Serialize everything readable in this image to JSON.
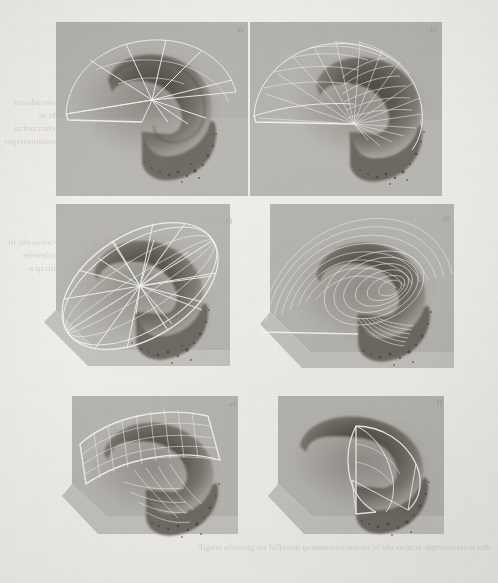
{
  "figure": {
    "kind": "scanned-halftone-figure",
    "medium": "grayscale scanned page from printed article",
    "caption_visible": false,
    "page_background": "#f2f0ec",
    "plate_background": "#b9b7b2",
    "wireframe_color": "#f4f3f0",
    "subject_color": "#5a564f",
    "layout": {
      "rows": 3,
      "columns": 2,
      "panel_count": 6
    },
    "bleed_through_text_visible": true
  },
  "panels": [
    {
      "id": "a",
      "label": "a)",
      "position": "top-left",
      "overlay_type": "radial-fan-wireframe",
      "description": "Dark spiral shell rendered inside a grey box, overlaid with an open fan of radial spokes meeting at a central apex and bounded by a wide circular arc.",
      "x": 56,
      "y": 22,
      "w": 192,
      "h": 174
    },
    {
      "id": "b",
      "label": "b)",
      "position": "top-right",
      "overlay_type": "dense-ruled-surface",
      "description": "Same shell overlaid with a dense family of nearly parallel ruling lines sweeping from the outer arc into the spiral core.",
      "x": 250,
      "y": 22,
      "w": 192,
      "h": 174
    },
    {
      "id": "c",
      "label": "c)",
      "position": "middle-left",
      "overlay_type": "elliptical-ring-with-spokes",
      "description": "Shell enclosed by a complete tilted elliptical ring band with radial spokes crossing the interior.",
      "x": 36,
      "y": 200,
      "w": 210,
      "h": 180
    },
    {
      "id": "d",
      "label": "d)",
      "position": "middle-right",
      "overlay_type": "nested-contour-curves",
      "description": "Shell overlaid with many nested level-set contour curves forming concentric loops around the core.",
      "x": 256,
      "y": 200,
      "w": 206,
      "h": 180
    },
    {
      "id": "e",
      "label": "e)",
      "position": "bottom-left",
      "overlay_type": "quadrilateral-grid-mesh",
      "description": "Shell overlaid with a curved rectangular quad-mesh patch draped across the upper surface.",
      "x": 60,
      "y": 392,
      "w": 186,
      "h": 152
    },
    {
      "id": "f",
      "label": "f)",
      "position": "bottom-right",
      "overlay_type": "minimal-cross-section-wireframe",
      "description": "Shell with only a few bounding cross-section curves and one planar cut quadrilateral.",
      "x": 266,
      "y": 392,
      "w": 186,
      "h": 152
    }
  ],
  "bleed_through": {
    "left_column": "noitcudortni eht ni debircsed sa ,noitatneserper",
    "left_column_2": "ecafrus eht fo gnileveler laitrap a",
    "gutter": "erugif",
    "bottom": "dna noitatneserper ecafrus eht fo snoitazireteamarap tnereffid xis gniwohs erugiF",
    "bottom_2": "sdohtem gnihsem evitanretla eht rof stluser"
  }
}
